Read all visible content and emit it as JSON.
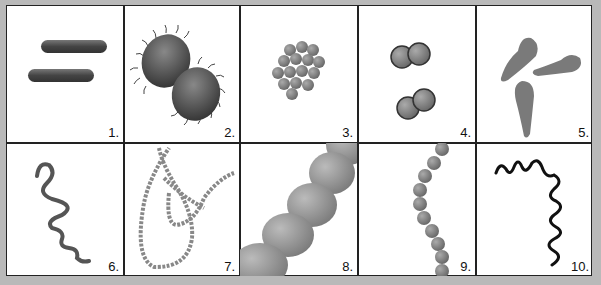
{
  "figure": {
    "title": "",
    "cells": [
      {
        "label": "1.",
        "shape": "bacilli-rods"
      },
      {
        "label": "2.",
        "shape": "flagellated-diplococci"
      },
      {
        "label": "3.",
        "shape": "staphylococci-cluster"
      },
      {
        "label": "4.",
        "shape": "diplococci-pairs"
      },
      {
        "label": "5.",
        "shape": "club-shaped-bacteria"
      },
      {
        "label": "6.",
        "shape": "spirillum"
      },
      {
        "label": "7.",
        "shape": "streptococcus-chain-long"
      },
      {
        "label": "8.",
        "shape": "streptobacillus-closeup"
      },
      {
        "label": "9.",
        "shape": "streptococcus-chain"
      },
      {
        "label": "10.",
        "shape": "spirochete"
      }
    ]
  },
  "colors": {
    "background": "#b9b9b9",
    "cell": "#ffffff",
    "border": "#222222",
    "dark_shape": "#555555",
    "mid_shape": "#8a8a8a"
  }
}
